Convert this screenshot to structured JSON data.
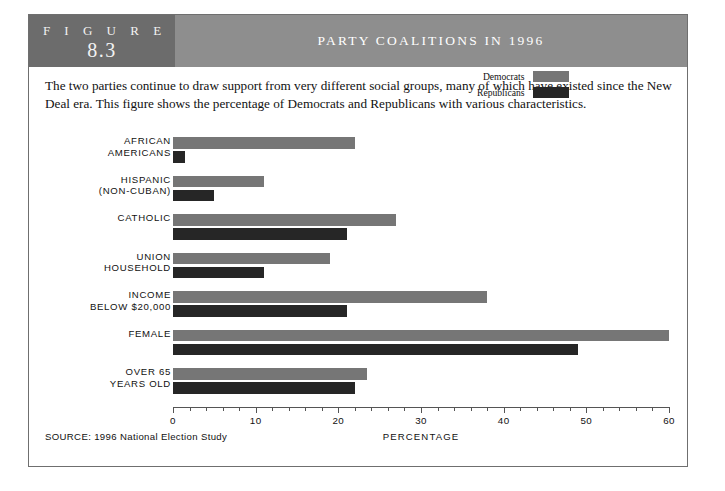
{
  "figure": {
    "label_word": "F I G U R E",
    "number": "8.3",
    "title": "PARTY COALITIONS IN 1996",
    "intro": "The two parties continue to draw support from very different social groups, many of which have existed since the New Deal era. This figure shows the percentage of Democrats and Republicans with various characteristics.",
    "source": "SOURCE: 1996 National Election Study"
  },
  "colors": {
    "democrat_bar": "#767676",
    "republican_bar": "#262626",
    "badge_band": "#6c6c6c",
    "title_band": "#8e8e8e",
    "frame_border": "#6f6f6f"
  },
  "legend": {
    "items": [
      {
        "label": "Democrats",
        "color": "#767676"
      },
      {
        "label": "Republicans",
        "color": "#262626"
      }
    ]
  },
  "chart_data": {
    "type": "bar",
    "orientation": "horizontal",
    "title": "PARTY COALITIONS IN 1996",
    "xlabel": "PERCENTAGE",
    "ylabel": "",
    "xlim": [
      0,
      60
    ],
    "xticks": [
      0,
      10,
      20,
      30,
      40,
      50,
      60
    ],
    "xtick_labels": [
      "0",
      "10",
      "20",
      "30",
      "40",
      "50",
      "60"
    ],
    "minor_tick_step": 2,
    "grid": false,
    "legend_position": "top-right",
    "categories": [
      "AFRICAN AMERICANS",
      "HISPANIC (NON-CUBAN)",
      "CATHOLIC",
      "UNION HOUSEHOLD",
      "INCOME BELOW $20,000",
      "FEMALE",
      "OVER 65 YEARS OLD"
    ],
    "category_lines": [
      [
        "AFRICAN",
        "AMERICANS"
      ],
      [
        "HISPANIC",
        "(NON-CUBAN)"
      ],
      [
        "CATHOLIC",
        ""
      ],
      [
        "UNION",
        "HOUSEHOLD"
      ],
      [
        "INCOME",
        "BELOW $20,000"
      ],
      [
        "FEMALE",
        ""
      ],
      [
        "OVER 65",
        "YEARS OLD"
      ]
    ],
    "series": [
      {
        "name": "Democrats",
        "color": "#767676",
        "values": [
          22,
          11,
          27,
          19,
          38,
          60,
          23.5
        ]
      },
      {
        "name": "Republicans",
        "color": "#262626",
        "values": [
          1.5,
          5,
          21,
          11,
          21,
          49,
          22
        ]
      }
    ]
  }
}
